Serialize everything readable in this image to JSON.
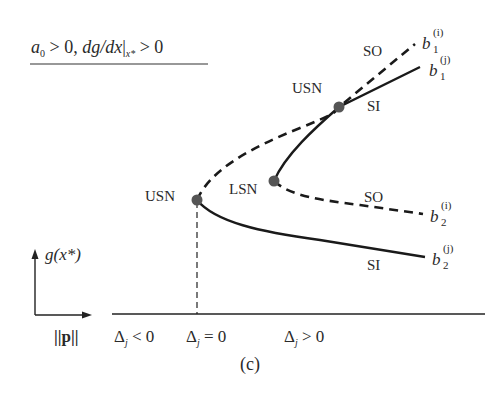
{
  "figure": {
    "condition": {
      "a": "a",
      "a_sub": "0",
      "rest1": " > 0, ",
      "dg": "dg/dx",
      "bar": "|",
      "x_sub": "x*",
      "rest2": " > 0"
    },
    "panel_label": "(c)",
    "axes": {
      "y_label": "g(x*)",
      "x_label": "||p||"
    },
    "regions": [
      {
        "delta": "Δ",
        "sub": "j",
        "rel": " < 0"
      },
      {
        "delta": "Δ",
        "sub": "j",
        "rel": " = 0"
      },
      {
        "delta": "Δ",
        "sub": "j",
        "rel": " > 0"
      }
    ],
    "points": {
      "usn_lower": "USN",
      "usn_upper": "USN",
      "lsn": "LSN"
    },
    "branch_labels": {
      "so_upper": "SO",
      "si_upper": "SI",
      "so_lower": "SO",
      "si_lower": "SI"
    },
    "branch_ends": [
      {
        "base": "b",
        "sub": "1",
        "sup": "(i)"
      },
      {
        "base": "b",
        "sub": "1",
        "sup": "(j)"
      },
      {
        "base": "b",
        "sub": "2",
        "sup": "(i)"
      },
      {
        "base": "b",
        "sub": "2",
        "sup": "(j)"
      }
    ],
    "legend_meaning": {
      "dashed": "unstable branch",
      "solid": "stable branch"
    },
    "colors": {
      "line": "#1a1a1a",
      "dot": "#555555"
    }
  }
}
